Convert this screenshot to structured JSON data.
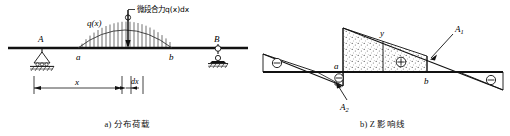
{
  "figure": {
    "background": "#ffffff",
    "line_color": "#000000",
    "beam_color": "#1a1a1a"
  },
  "panel_a": {
    "caption": "a) 分布荷载",
    "labels": {
      "q_of_x": "q(x)",
      "resultant": "微段合力q(x)dx",
      "support_left": "A",
      "support_right": "B",
      "load_start": "a",
      "load_end": "b",
      "dim_x": "x",
      "dim_dx": "dx"
    },
    "icons": {
      "pin_support": "pin-support-icon",
      "roller_support": "roller-support-icon",
      "load_arrow": "downward-force-arrow-icon",
      "distributed_load": "distributed-load-hatching-icon",
      "dimension_line": "dimension-line-icon"
    },
    "geometry": {
      "beam_y": 48,
      "beam_x_start": 8,
      "beam_x_end": 248,
      "support_A_x": 42,
      "support_B_x": 218,
      "load_a_x": 78,
      "load_b_x": 172,
      "load_peak_y": 20,
      "arrow_x": 128,
      "dim_y": 88
    }
  },
  "panel_b": {
    "caption": "b) Z 影响线",
    "labels": {
      "ordinate": "y",
      "area_positive": "A1",
      "area_positive_sub": "1",
      "area_negative": "A2",
      "area_negative_sub": "2",
      "load_start": "a",
      "load_end": "b",
      "sign_positive": "⊕",
      "sign_negative": "⊖"
    },
    "icons": {
      "plus_circle": "plus-circle-icon",
      "minus_circle": "minus-circle-icon",
      "leader_arrow": "leader-arrow-icon",
      "stipple_fill": "stipple-fill-icon"
    },
    "signs": [
      {
        "name": "left-negative",
        "symbol": "⊖",
        "x": 46,
        "y": 63
      },
      {
        "name": "small-negative",
        "symbol": "⊖",
        "x": 95,
        "y": 80
      },
      {
        "name": "center-positive",
        "symbol": "⊕",
        "x": 170,
        "y": 63
      },
      {
        "name": "right-negative",
        "symbol": "⊖",
        "x": 213,
        "y": 80
      }
    ],
    "geometry": {
      "axis_y": 72,
      "axis_x_start": 8,
      "axis_x_end": 248,
      "zero_left_x": 62,
      "zero_right_x": 204,
      "a_x": 88,
      "b_x": 172,
      "y_ordinate_x": 128
    }
  }
}
